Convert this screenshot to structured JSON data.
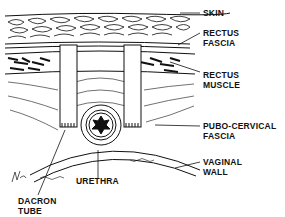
{
  "diagram": {
    "type": "anatomical-cross-section",
    "colors": {
      "ink": "#111111",
      "background": "#ffffff"
    },
    "labels": {
      "skin": "SKIN",
      "rectus_fascia_1": "RECTUS",
      "rectus_fascia_2": "FASCIA",
      "rectus_muscle_1": "RECTUS",
      "rectus_muscle_2": "MUSCLE",
      "pubo_1": "PUBO-CERVICAL",
      "pubo_2": "FASCIA",
      "vaginal_1": "VAGINAL",
      "vaginal_2": "WALL",
      "urethra": "URETHRA",
      "dacron_1": "DACRON",
      "dacron_2": "TUBE"
    }
  }
}
